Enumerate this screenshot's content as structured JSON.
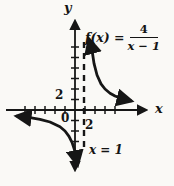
{
  "figure": {
    "background_color": "#faf9f6",
    "ink_color": "#161616",
    "y_axis_label": "y",
    "x_axis_label": "x",
    "function_label": {
      "prefix": "f(x) =",
      "numerator": "4",
      "denominator": "x − 1"
    },
    "asymptote_label": "x = 1",
    "tick_labels": {
      "y_axis_2": "2",
      "origin": "0",
      "x_axis_2": "2"
    }
  },
  "chart_data": {
    "type": "line",
    "xlabel": "x",
    "ylabel": "y",
    "function": "f(x) = 4/(x-1)",
    "vertical_asymptote_x": 1,
    "horizontal_asymptote_y": 0,
    "x_tick_spacing": 1,
    "y_tick_spacing": 1,
    "x_ticks": [
      -5,
      -4,
      -3,
      -2,
      -1,
      1,
      2,
      3,
      4
    ],
    "y_ticks": [
      -3,
      -2,
      -1,
      1,
      2,
      3,
      4,
      5,
      6
    ],
    "labeled_ticks": {
      "x_axis": [
        0,
        2
      ],
      "y_axis": [
        2
      ]
    },
    "legend": null,
    "grid": false,
    "annotations": [
      "f(x) = 4/(x − 1)",
      "x = 1"
    ],
    "series": [
      {
        "name": "left-branch",
        "domain": "x < 1",
        "x": [
          -5.8,
          -4.5,
          -3.5,
          -2.5,
          -1.5,
          -1.0,
          -0.6,
          -0.3,
          -0.1,
          0.05,
          0.15,
          0.25
        ],
        "y": [
          -0.59,
          -0.73,
          -0.89,
          -1.14,
          -1.6,
          -2.0,
          -2.5,
          -3.08,
          -3.64,
          -4.21,
          -4.71,
          -5.33
        ]
      },
      {
        "name": "right-branch",
        "domain": "x > 1",
        "x": [
          1.42,
          1.7,
          1.9,
          2.2,
          2.6,
          3.0,
          3.5,
          4.0,
          4.7,
          5.6
        ],
        "y": [
          9.52,
          5.71,
          4.44,
          3.33,
          2.5,
          2.0,
          1.6,
          1.33,
          1.08,
          0.87
        ]
      }
    ]
  }
}
